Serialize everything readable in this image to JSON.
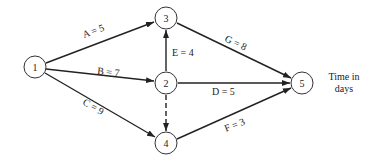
{
  "diagram": {
    "type": "activity-network",
    "nodes": [
      {
        "id": "1",
        "label": "1",
        "x": 35,
        "y": 67
      },
      {
        "id": "2",
        "label": "2",
        "x": 166,
        "y": 83
      },
      {
        "id": "3",
        "label": "3",
        "x": 166,
        "y": 18
      },
      {
        "id": "4",
        "label": "4",
        "x": 166,
        "y": 143
      },
      {
        "id": "5",
        "label": "5",
        "x": 302,
        "y": 83
      }
    ],
    "edges": [
      {
        "id": "A",
        "from": "1",
        "to": "3",
        "activity": "A",
        "duration": "5",
        "text": "A = 5",
        "style": "solid"
      },
      {
        "id": "B",
        "from": "1",
        "to": "2",
        "activity": "B",
        "duration": "7",
        "text": "B = 7",
        "style": "solid"
      },
      {
        "id": "C",
        "from": "1",
        "to": "4",
        "activity": "C",
        "duration": "9",
        "text": "C = 9",
        "style": "solid"
      },
      {
        "id": "E",
        "from": "2",
        "to": "3",
        "activity": "E",
        "duration": "4",
        "text": "E = 4",
        "style": "solid"
      },
      {
        "id": "dummy",
        "from": "2",
        "to": "4",
        "activity": "",
        "duration": "",
        "text": "",
        "style": "dashed"
      },
      {
        "id": "D",
        "from": "2",
        "to": "5",
        "activity": "D",
        "duration": "5",
        "text": "D = 5",
        "style": "solid"
      },
      {
        "id": "G",
        "from": "3",
        "to": "5",
        "activity": "G",
        "duration": "8",
        "text": "G = 8",
        "style": "solid"
      },
      {
        "id": "F",
        "from": "4",
        "to": "5",
        "activity": "F",
        "duration": "3",
        "text": "F = 3",
        "style": "solid"
      }
    ],
    "note": {
      "line1": "Time in",
      "line2": "days"
    }
  }
}
